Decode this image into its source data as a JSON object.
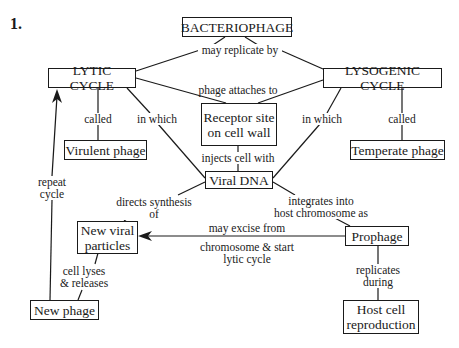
{
  "problem_number": "1.",
  "nodes": {
    "bacteriophage": "BACTERIOPHAGE",
    "lytic_cycle": "LYTIC CYCLE",
    "lysogenic_cycle": "LYSOGENIC CYCLE",
    "receptor_site": "Receptor site\non cell wall",
    "virulent_phage": "Virulent phage",
    "temperate_phage": "Temperate phage",
    "viral_dna": "Viral DNA",
    "new_viral_particles": "New viral\nparticles",
    "prophage": "Prophage",
    "new_phage": "New phage",
    "host_cell_reproduction": "Host cell\nreproduction"
  },
  "links": {
    "may_replicate_by": "may replicate by",
    "phage_attaches_to": "phage attaches to",
    "lytic_called": "called",
    "lytic_in_which": "in which",
    "lysogenic_in_which": "in which",
    "lysogenic_called": "called",
    "injects_cell_with": "injects cell with",
    "repeat_cycle": "repeat\ncycle",
    "directs_synthesis_of": "directs synthesis\nof",
    "integrates_into": "integrates into\nhost chromosome as",
    "may_excise_from": "may excise from",
    "chromosome_start": "chromosome & start\nlytic cycle",
    "cell_lyses": "cell lyses\n& releases",
    "replicates_during": "replicates\nduring"
  }
}
